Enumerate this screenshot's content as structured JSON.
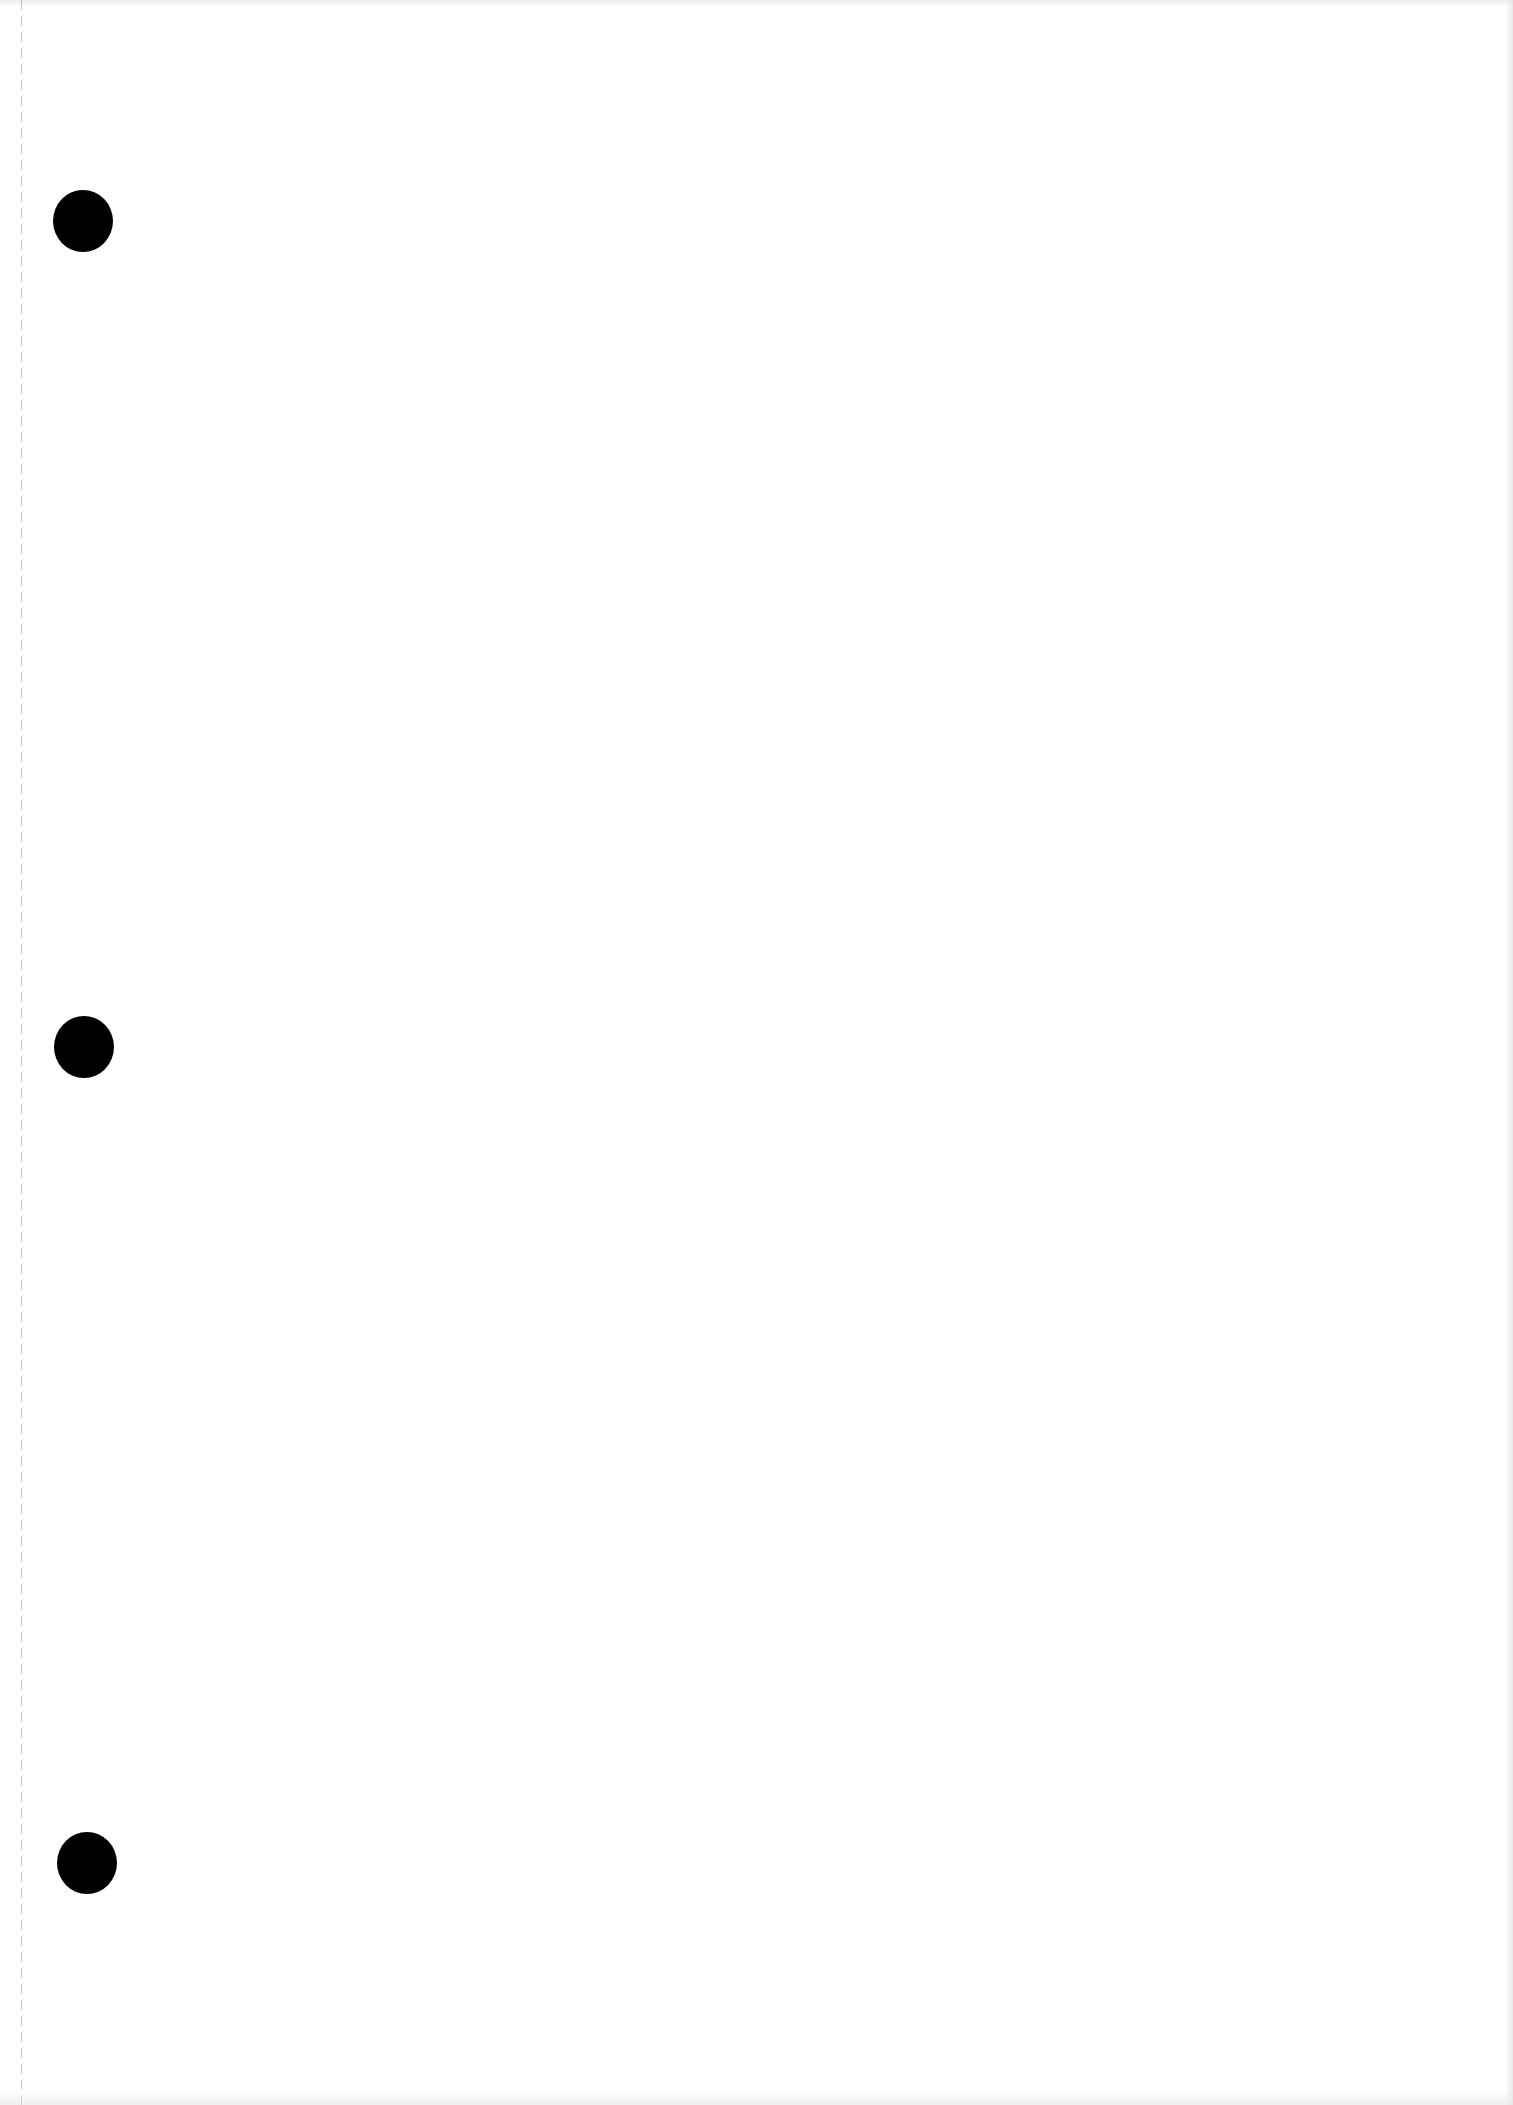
{
  "document": {
    "type": "blank-punched-sheet",
    "text": "",
    "background_color": "#ffffff",
    "perforation": {
      "style": "dashed",
      "color": "#b9b9b9",
      "x": 21
    },
    "punch_holes": [
      {
        "label": "punch-hole-top",
        "cx": 83,
        "cy": 221,
        "color": "#000000"
      },
      {
        "label": "punch-hole-middle",
        "cx": 84,
        "cy": 1047,
        "color": "#000000"
      },
      {
        "label": "punch-hole-bottom",
        "cx": 87,
        "cy": 1863,
        "color": "#000000"
      }
    ]
  }
}
